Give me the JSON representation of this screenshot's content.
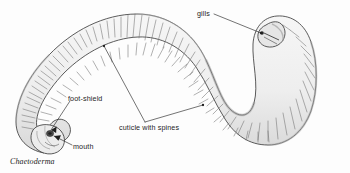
{
  "figure": {
    "caption": "Chaetoderma",
    "organism": "Chaetoderma",
    "style": "pen-and-ink scientific line drawing",
    "background_color": "#fdfdfd",
    "line_color": "#3b3b3b",
    "body_fill_color": "#efefef",
    "shade_color": "#b9b9b9",
    "label_text_color": "#1d1d1d"
  },
  "labels": {
    "gills": "gills",
    "foot_shield": "foot-shield",
    "mouth": "mouth",
    "cuticle_with_spines": "cuticle with spines"
  },
  "annotations": [
    {
      "id": "gills",
      "label": "gills",
      "leader": "line",
      "text_anchor": [
        197,
        10
      ],
      "target_point": [
        280,
        40
      ]
    },
    {
      "id": "foot-shield",
      "label": "foot-shield",
      "leader": "line",
      "text_anchor": [
        68,
        95
      ],
      "target_point": [
        49,
        126
      ]
    },
    {
      "id": "mouth",
      "label": "mouth",
      "leader": "arrow",
      "text_anchor": [
        73,
        143
      ],
      "target_point": [
        51,
        134
      ]
    },
    {
      "id": "cuticle-with-spines",
      "label": "cuticle with spines",
      "leader": "two-branch",
      "text_anchor": [
        119,
        124
      ],
      "target_point_a": [
        104,
        46
      ],
      "target_point_b": [
        203,
        105
      ]
    }
  ],
  "anatomy": [
    {
      "part": "anterior-foot-shield-end",
      "position": "lower-left"
    },
    {
      "part": "mouth",
      "position": "lower-left tip"
    },
    {
      "part": "trunk",
      "position": "S-curve across figure"
    },
    {
      "part": "posterior-gill-end",
      "position": "upper-right"
    }
  ]
}
